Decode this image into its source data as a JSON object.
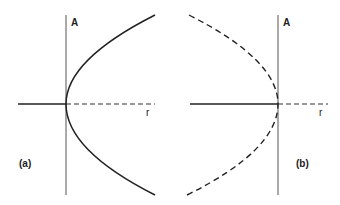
{
  "panels": [
    {
      "id": "a",
      "caption": "(a)",
      "vertical_axis_label": "A",
      "horizontal_axis_label": "r",
      "curve_style": "solid",
      "curve_opens": "right",
      "positive_r_axis_style": "dashed"
    },
    {
      "id": "b",
      "caption": "(b)",
      "vertical_axis_label": "A",
      "horizontal_axis_label": "r",
      "curve_style": "dashed",
      "curve_opens": "left",
      "positive_r_axis_style": "dashed"
    }
  ],
  "colors": {
    "line": "#222222",
    "axis": "#555555"
  }
}
